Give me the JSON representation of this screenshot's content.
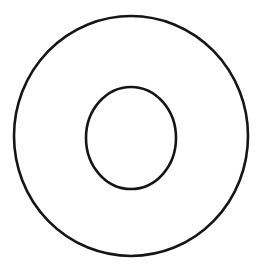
{
  "figure": {
    "name": "concentric-circles-annulus",
    "title": "Concentric circles (annulus / washer outline)",
    "canvas": {
      "width": 267,
      "height": 278,
      "background_color": "#ffffff"
    }
  },
  "chart_data": {
    "type": "diagram",
    "title": "",
    "subtitle": "",
    "xlabel": "",
    "ylabel": "",
    "grid": false,
    "legend": false,
    "legend_position": "none",
    "axis_visible": false,
    "tick_labels": [],
    "annotations": [],
    "shapes": [
      {
        "name": "outer-circle",
        "type": "circle",
        "center_x": 131,
        "center_y": 136,
        "radius": 117,
        "radius_x": 117,
        "radius_y": 120,
        "diameter": 234,
        "stroke_color": "#151515",
        "stroke_width": 2.6,
        "fill": "none",
        "bounds": {
          "left": 14,
          "top": 16,
          "right": 248,
          "bottom": 256
        }
      },
      {
        "name": "inner-circle",
        "type": "circle",
        "center_x": 131,
        "center_y": 138,
        "radius": 45,
        "radius_x": 45,
        "radius_y": 51,
        "diameter": 90,
        "stroke_color": "#151515",
        "stroke_width": 2.6,
        "fill": "none",
        "bounds": {
          "left": 86,
          "top": 87,
          "right": 176,
          "bottom": 189
        }
      }
    ],
    "ratio_inner_to_outer_radius": 0.38,
    "colors": {
      "stroke": "#151515",
      "background": "#ffffff",
      "fill": "none"
    }
  }
}
